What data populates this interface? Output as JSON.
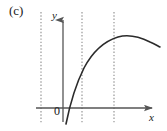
{
  "figure": {
    "panel_label": "(c)",
    "axis_labels": {
      "x": "x",
      "y": "y"
    },
    "origin_label": "0",
    "colors": {
      "axis": "#555555",
      "curve": "#2b2b2b",
      "gridline": "#8c8c8c",
      "text": "#1a1a1a",
      "background": "#ffffff"
    }
  },
  "chart_data": {
    "type": "line",
    "title": "(c)",
    "xlabel": "x",
    "ylabel": "y",
    "grid": true,
    "grid_orientation": "vertical-dotted",
    "legend": "none",
    "annotations": [
      "0"
    ],
    "axis_origin_px": [
      63,
      108
    ],
    "xlim_px": [
      36,
      160
    ],
    "ylim_px": [
      12,
      124
    ],
    "gridlines_x_px": [
      41,
      82,
      114
    ],
    "x": [
      66,
      68,
      71,
      74,
      78,
      82,
      87,
      93,
      100,
      107,
      114,
      121,
      128,
      135,
      142,
      149,
      156,
      160
    ],
    "y": [
      124,
      110,
      97,
      88,
      79,
      70,
      62,
      55,
      49,
      44,
      41,
      38,
      36,
      36,
      37,
      40,
      44,
      47
    ],
    "curve_path": "M 66,124 C 70,104 76,84 84,68 C 93,51 105,41 118,37 C 128,34 140,37 150,42 C 155,44 158,46 160,47",
    "x_axis_crossing_px": 69,
    "peak_px": [
      130,
      36
    ]
  }
}
